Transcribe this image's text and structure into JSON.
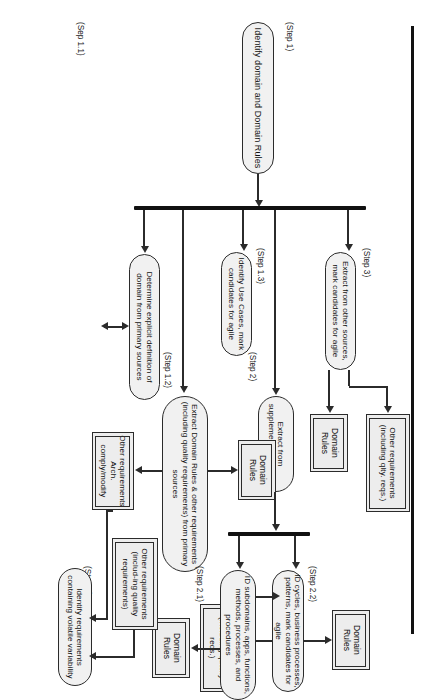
{
  "diagram": {
    "title": "Identify domain and Domain Rules",
    "type": "flowchart",
    "orientation": "rotated-90-landscape-on-portrait-page",
    "steps": {
      "step1": "(Step 1)",
      "step1_1": "(Sep 1.1)",
      "step1_2": "(Step 1.2)",
      "step1_3": "(Step 1.3)",
      "step2": "(Step 2)",
      "step2_1": "(Step 2.1)",
      "step2_2": "(Step 2.2)",
      "step3": "(Step 3)",
      "step4": "(Step 4)"
    },
    "nodes": {
      "root": "Identify domain and Domain Rules",
      "determine_domain": "Determine explicit definition of domain from primary sources",
      "extract_primary": "Extract Domain Rules & other requirements (including quality requirements) from primary sources",
      "identify_use_cases": "Identify Use Cases, mark candidates for agile",
      "extract_other_sources": "Extract from other sources, mark candidates for agile",
      "extract_supplemental": "Extract from supplemental sources",
      "id_subdomains": "ID subdomains, apps, functions, methods, processes, and procedures",
      "id_cycles": "ID cycles, business processes, patterns, mark candidates for agile",
      "identify_volatile": "Identify requirements containing volatile variability",
      "domain_rules_1": "Domain Rules",
      "domain_rules_2": "Domain Rules",
      "domain_rules_3": "Domain Rules",
      "domain_rules_4": "Domain Rules",
      "other_req_qlty": "Other requirements (including qlty. reqs.)",
      "other_req_quality": "Other requirements (including quality reqs.)",
      "other_req_incl_quality": "Other requirements (includ-ing quality requirements)",
      "other_req_arch": "Other requirements Arch. comply/modify"
    },
    "colors": {
      "node_fill": "#f1f1f1",
      "node_stroke": "#2b2b2b",
      "bar": "#111111",
      "page": "#ffffff"
    }
  }
}
